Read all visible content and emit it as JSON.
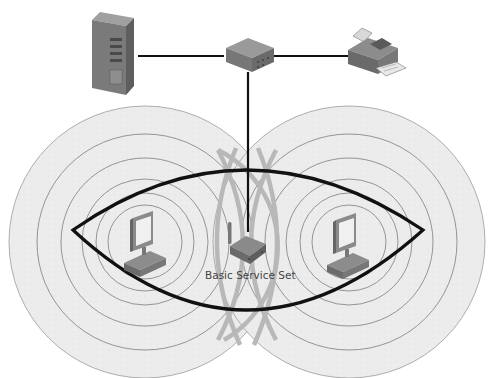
{
  "diagram": {
    "labels": {
      "bss": "Basic Service Set"
    },
    "nodes": [
      {
        "id": "server",
        "type": "server",
        "icon": "server-icon"
      },
      {
        "id": "switch",
        "type": "switch",
        "icon": "switch-icon"
      },
      {
        "id": "printer",
        "type": "printer",
        "icon": "printer-icon"
      },
      {
        "id": "access-point",
        "type": "wireless-access-point",
        "icon": "wireless-router-icon"
      },
      {
        "id": "client-left",
        "type": "workstation",
        "icon": "desktop-computer-icon"
      },
      {
        "id": "client-right",
        "type": "workstation",
        "icon": "desktop-computer-icon"
      }
    ],
    "links": [
      {
        "from": "server",
        "to": "switch",
        "type": "wired"
      },
      {
        "from": "switch",
        "to": "printer",
        "type": "wired"
      },
      {
        "from": "switch",
        "to": "access-point",
        "type": "wired"
      }
    ],
    "coverage": [
      {
        "around": "client-left",
        "rings": 6
      },
      {
        "around": "client-right",
        "rings": 6
      }
    ],
    "colors": {
      "line": "#111111",
      "ring": "#8a8a8a",
      "coverage_fill": "#ececec",
      "overlap_arc": "#b5b5b5",
      "device_dark": "#6e6e6e",
      "device_mid": "#8c8c8c",
      "device_light": "#a8a8a8",
      "label": "#444444"
    }
  }
}
